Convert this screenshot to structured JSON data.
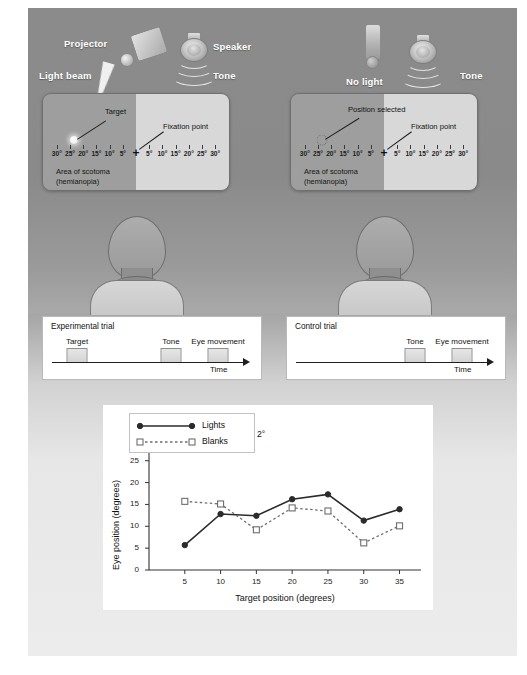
{
  "figure": {
    "panels": {
      "experimental": {
        "equipment": {
          "projector_label": "Projector",
          "light_label": "Light beam",
          "speaker_label": "Speaker",
          "tone_label": "Tone"
        },
        "display": {
          "target_label": "Target",
          "fixation_label": "Fixation point",
          "scotoma_label": "Area of scotoma\n(hemianopia)",
          "scotoma_line1": "Area of scotoma",
          "scotoma_line2": "(hemianopia)",
          "fixation_symbol": "+",
          "left_degrees": [
            "30°",
            "25°",
            "20°",
            "15°",
            "10°",
            "5°"
          ],
          "right_degrees": [
            "5°",
            "10°",
            "15°",
            "20°",
            "25°",
            "30°"
          ],
          "target_position_deg": 25
        },
        "trial": {
          "title": "Experimental trial",
          "events": [
            "Target",
            "Tone",
            "Eye movement"
          ],
          "time_label": "Time"
        }
      },
      "control": {
        "equipment": {
          "projector_label": "No light",
          "speaker_label": "",
          "tone_label": "Tone"
        },
        "display": {
          "target_label": "Position selected",
          "fixation_label": "Fixation point",
          "scotoma_line1": "Area of scotoma",
          "scotoma_line2": "(hemianopia)",
          "fixation_symbol": "+",
          "left_degrees": [
            "30°",
            "25°",
            "20°",
            "15°",
            "10°",
            "5°"
          ],
          "right_degrees": [
            "5°",
            "10°",
            "15°",
            "20°",
            "25°",
            "30°"
          ],
          "target_position_deg": 25
        },
        "trial": {
          "title": "Control trial",
          "events": [
            "Tone",
            "Eye movement"
          ],
          "time_label": "Time"
        }
      }
    }
  },
  "chart_data": {
    "type": "line",
    "title": "",
    "xlabel": "Target position (degrees)",
    "ylabel": "Eye position (degrees)",
    "x": [
      5,
      10,
      15,
      20,
      25,
      30,
      35
    ],
    "xlim": [
      0,
      38
    ],
    "ylim": [
      0,
      35
    ],
    "xticks": [
      5,
      10,
      15,
      20,
      25,
      30,
      35
    ],
    "yticks": [
      0,
      5,
      10,
      15,
      20,
      25,
      30,
      35
    ],
    "grid": false,
    "legend_position": "top-left",
    "annotation": "2°",
    "series": [
      {
        "name": "Lights",
        "values": [
          5.7,
          12.8,
          12.4,
          16.2,
          17.3,
          11.3,
          13.9
        ],
        "style": "solid",
        "marker": "filled-circle",
        "color": "#2b2b2b"
      },
      {
        "name": "Blanks",
        "values": [
          15.7,
          15.1,
          9.2,
          14.2,
          13.5,
          6.2,
          10.1
        ],
        "style": "dotted",
        "marker": "open-square",
        "color": "#6e6e6e"
      }
    ]
  }
}
